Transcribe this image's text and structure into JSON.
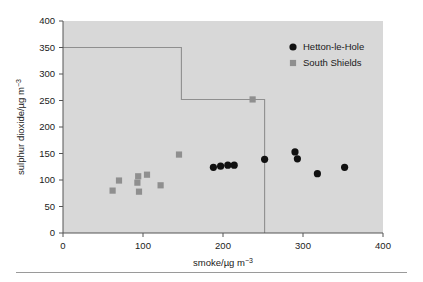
{
  "chart_data": {
    "type": "scatter",
    "title": "",
    "xlabel": "smoke/µg m −3",
    "ylabel": "sulphur dioxide/µg m −3",
    "xlim": [
      0,
      400
    ],
    "ylim": [
      0,
      400
    ],
    "xticks": [
      0,
      100,
      200,
      300,
      400
    ],
    "yticks": [
      0,
      50,
      100,
      150,
      200,
      250,
      300,
      350,
      400
    ],
    "grid": false,
    "plot_background": "#d8d8d8",
    "legend_position": "top-right",
    "series": [
      {
        "name": "Hetton-le-Hole",
        "marker": "circle",
        "color": "#111111",
        "points": [
          {
            "x": 188,
            "y": 124
          },
          {
            "x": 197,
            "y": 126
          },
          {
            "x": 206,
            "y": 128
          },
          {
            "x": 214,
            "y": 128
          },
          {
            "x": 252,
            "y": 139
          },
          {
            "x": 290,
            "y": 153
          },
          {
            "x": 293,
            "y": 140
          },
          {
            "x": 318,
            "y": 112
          },
          {
            "x": 352,
            "y": 124
          }
        ]
      },
      {
        "name": "South Shields",
        "marker": "square",
        "color": "#8f8f8f",
        "points": [
          {
            "x": 62,
            "y": 80
          },
          {
            "x": 70,
            "y": 99
          },
          {
            "x": 93,
            "y": 95
          },
          {
            "x": 94,
            "y": 107
          },
          {
            "x": 95,
            "y": 78
          },
          {
            "x": 105,
            "y": 110
          },
          {
            "x": 122,
            "y": 90
          },
          {
            "x": 145,
            "y": 148
          },
          {
            "x": 237,
            "y": 252
          }
        ]
      }
    ],
    "step_line": {
      "name": "guideline",
      "color": "#8f8f8f",
      "points": [
        {
          "x": 0,
          "y": 350
        },
        {
          "x": 148,
          "y": 350
        },
        {
          "x": 148,
          "y": 252
        },
        {
          "x": 252,
          "y": 252
        },
        {
          "x": 252,
          "y": 0
        }
      ]
    }
  },
  "axes": {
    "x_tick_labels": [
      "0",
      "100",
      "200",
      "300",
      "400"
    ],
    "y_tick_labels": [
      "0",
      "50",
      "100",
      "150",
      "200",
      "250",
      "300",
      "350",
      "400"
    ],
    "x_title_main": "smoke/µg m",
    "x_title_sup": "−3",
    "y_title_main": "sulphur dioxide/µg m",
    "y_title_sup": "−3"
  },
  "legend": {
    "entries": [
      {
        "label": "Hetton-le-Hole",
        "marker": "circle",
        "color": "#111111"
      },
      {
        "label": "South Shields",
        "marker": "square",
        "color": "#8f8f8f"
      }
    ]
  }
}
